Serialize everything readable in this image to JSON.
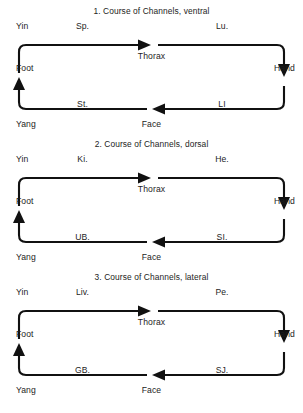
{
  "page": {
    "background": "#ffffff",
    "ink": "#1a1a1a"
  },
  "labels": {
    "yin": "Yin",
    "yang": "Yang",
    "foot": "Foot",
    "hand": "Hand",
    "thorax": "Thorax",
    "face": "Face"
  },
  "blocks": [
    {
      "title": "1. Course of Channels, ventral",
      "top_left": "Sp.",
      "top_right": "Lu.",
      "bottom_left": "St.",
      "bottom_right": "LI"
    },
    {
      "title": "2. Course of Channels, dorsal",
      "top_left": "Ki.",
      "top_right": "He.",
      "bottom_left": "UB.",
      "bottom_right": "SI."
    },
    {
      "title": "3. Course of Channels, lateral",
      "top_left": "Liv.",
      "top_right": "Pe.",
      "bottom_left": "GB.",
      "bottom_right": "SJ."
    }
  ]
}
